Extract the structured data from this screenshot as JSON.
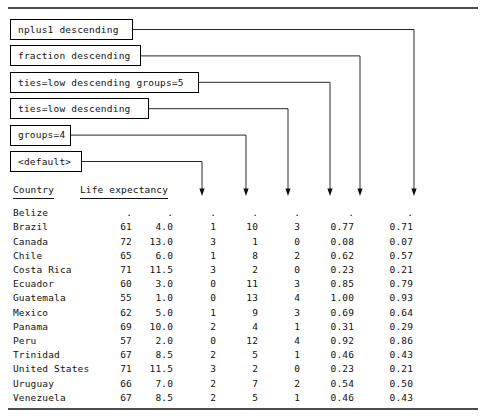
{
  "figure": {
    "rule_color": "#111111",
    "top_rule_y": 8,
    "bottom_rule_y": 409
  },
  "callouts": [
    {
      "label": "nplus1 descending",
      "box_right": 133,
      "arrow_x": 414
    },
    {
      "label": "fraction descending",
      "box_right": 141,
      "arrow_x": 360
    },
    {
      "label": "ties=low descending groups=5",
      "box_right": 199,
      "arrow_x": 330
    },
    {
      "label": "ties=low descending",
      "box_right": 149,
      "arrow_x": 288
    },
    {
      "label": "groups=4",
      "box_right": 71,
      "arrow_x": 246
    },
    {
      "label": "<default>",
      "box_right": 82,
      "arrow_x": 202
    }
  ],
  "table": {
    "headers": {
      "country": "Country",
      "life_expectancy": "Life expectancy"
    },
    "missing_symbol": ".",
    "rows": [
      {
        "country": "Belize",
        "life": ".",
        "c1": ".",
        "c2": ".",
        "c3": ".",
        "c4": ".",
        "c5": ".",
        "c6": "."
      },
      {
        "country": "Brazil",
        "life": "61",
        "c1": "4.0",
        "c2": "1",
        "c3": "10",
        "c4": "3",
        "c5": "0.77",
        "c6": "0.71"
      },
      {
        "country": "Canada",
        "life": "72",
        "c1": "13.0",
        "c2": "3",
        "c3": "1",
        "c4": "0",
        "c5": "0.08",
        "c6": "0.07"
      },
      {
        "country": "Chile",
        "life": "65",
        "c1": "6.0",
        "c2": "1",
        "c3": "8",
        "c4": "2",
        "c5": "0.62",
        "c6": "0.57"
      },
      {
        "country": "Costa Rica",
        "life": "71",
        "c1": "11.5",
        "c2": "3",
        "c3": "2",
        "c4": "0",
        "c5": "0.23",
        "c6": "0.21"
      },
      {
        "country": "Ecuador",
        "life": "60",
        "c1": "3.0",
        "c2": "0",
        "c3": "11",
        "c4": "3",
        "c5": "0.85",
        "c6": "0.79"
      },
      {
        "country": "Guatemala",
        "life": "55",
        "c1": "1.0",
        "c2": "0",
        "c3": "13",
        "c4": "4",
        "c5": "1.00",
        "c6": "0.93"
      },
      {
        "country": "Mexico",
        "life": "62",
        "c1": "5.0",
        "c2": "1",
        "c3": "9",
        "c4": "3",
        "c5": "0.69",
        "c6": "0.64"
      },
      {
        "country": "Panama",
        "life": "69",
        "c1": "10.0",
        "c2": "2",
        "c3": "4",
        "c4": "1",
        "c5": "0.31",
        "c6": "0.29"
      },
      {
        "country": "Peru",
        "life": "57",
        "c1": "2.0",
        "c2": "0",
        "c3": "12",
        "c4": "4",
        "c5": "0.92",
        "c6": "0.86"
      },
      {
        "country": "Trinidad",
        "life": "67",
        "c1": "8.5",
        "c2": "2",
        "c3": "5",
        "c4": "1",
        "c5": "0.46",
        "c6": "0.43"
      },
      {
        "country": "United States",
        "life": "71",
        "c1": "11.5",
        "c2": "3",
        "c3": "2",
        "c4": "0",
        "c5": "0.23",
        "c6": "0.21"
      },
      {
        "country": "Uruguay",
        "life": "66",
        "c1": "7.0",
        "c2": "2",
        "c3": "7",
        "c4": "2",
        "c5": "0.54",
        "c6": "0.50"
      },
      {
        "country": "Venezuela",
        "life": "67",
        "c1": "8.5",
        "c2": "2",
        "c3": "5",
        "c4": "1",
        "c5": "0.46",
        "c6": "0.43"
      }
    ]
  }
}
